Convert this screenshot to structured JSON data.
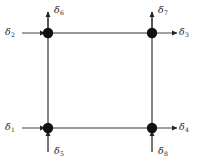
{
  "figure": {
    "type": "structural-dof-diagram",
    "background_color": "#ffffff",
    "node_color": "#111111",
    "member_color": "#9a9a9a",
    "arrow_color": "#222222",
    "label_color": "#1a1a1a"
  },
  "geometry": {
    "nodes": [
      {
        "id": "node-top-left",
        "x": 48,
        "y": 33
      },
      {
        "id": "node-top-right",
        "x": 152,
        "y": 33
      },
      {
        "id": "node-bottom-left",
        "x": 48,
        "y": 128
      },
      {
        "id": "node-bottom-right",
        "x": 152,
        "y": 128
      }
    ],
    "node_radius": 5.2,
    "members": [
      {
        "id": "member-top",
        "from": "node-top-left",
        "to": "node-top-right"
      },
      {
        "id": "member-bottom",
        "from": "node-bottom-left",
        "to": "node-bottom-right"
      },
      {
        "id": "member-left",
        "from": "node-top-left",
        "to": "node-bottom-left"
      },
      {
        "id": "member-right",
        "from": "node-top-right",
        "to": "node-bottom-right"
      }
    ]
  },
  "dofs": [
    {
      "id": "d1",
      "symbol": "δ",
      "subscript": "1",
      "node": "node-bottom-left",
      "direction": "right",
      "label_position": "left-of-node"
    },
    {
      "id": "d2",
      "symbol": "δ",
      "subscript": "2",
      "node": "node-top-left",
      "direction": "right",
      "label_position": "left-of-node"
    },
    {
      "id": "d3",
      "symbol": "δ",
      "subscript": "3",
      "node": "node-top-right",
      "direction": "right",
      "label_position": "right-of-node"
    },
    {
      "id": "d4",
      "symbol": "δ",
      "subscript": "4",
      "node": "node-bottom-right",
      "direction": "right",
      "label_position": "right-of-node"
    },
    {
      "id": "d5",
      "symbol": "δ",
      "subscript": "5",
      "node": "node-bottom-left",
      "direction": "up",
      "label_position": "below-node"
    },
    {
      "id": "d6",
      "symbol": "δ",
      "subscript": "6",
      "node": "node-top-left",
      "direction": "up",
      "label_position": "above-node"
    },
    {
      "id": "d7",
      "symbol": "δ",
      "subscript": "7",
      "node": "node-top-right",
      "direction": "up",
      "label_position": "above-node"
    },
    {
      "id": "d8",
      "symbol": "δ",
      "subscript": "8",
      "node": "node-bottom-right",
      "direction": "up",
      "label_position": "below-node"
    }
  ],
  "labels": {
    "d1": {
      "symbol": "δ",
      "subscript": "1"
    },
    "d2": {
      "symbol": "δ",
      "subscript": "2"
    },
    "d3": {
      "symbol": "δ",
      "subscript": "3"
    },
    "d4": {
      "symbol": "δ",
      "subscript": "4"
    },
    "d5": {
      "symbol": "δ",
      "subscript": "5"
    },
    "d6": {
      "symbol": "δ",
      "subscript": "6"
    },
    "d7": {
      "symbol": "δ",
      "subscript": "7"
    },
    "d8": {
      "symbol": "δ",
      "subscript": "8"
    }
  }
}
